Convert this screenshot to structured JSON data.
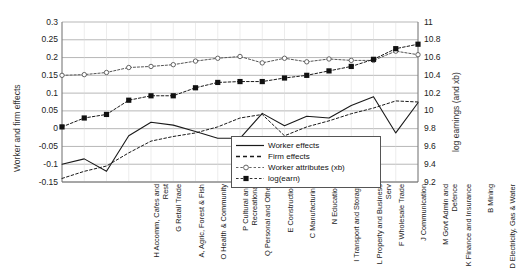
{
  "chart_data": {
    "type": "line",
    "title": "",
    "xlabel": "",
    "ylabel": "Worker and firm effects",
    "ylabel_right": "log earnings (and xb)",
    "grid": true,
    "legend_position": "inside-bottom-right",
    "ylim": [
      -0.15,
      0.3
    ],
    "yticks": [
      "0.3",
      "0.25",
      "0.2",
      "0.15",
      "0.1",
      "0.05",
      "0",
      "-0.05",
      "-0.1",
      "-0.15"
    ],
    "ylim_right": [
      9.2,
      11
    ],
    "yticks_right": [
      "11",
      "10.8",
      "10.6",
      "10.4",
      "10.2",
      "10",
      "9.8",
      "9.6",
      "9.4",
      "9.2"
    ],
    "categories": [
      "H Accomm, Cafes and Rest",
      "G Retail Trade",
      "A, Agric, Forest & Fish",
      "O Health & Community",
      "P Cultural and Recreational",
      "Q Personal and Other",
      "E Construction",
      "C Manufacturing",
      "N Education",
      "I Transport and Storage",
      "L Property and Business Serv",
      "F Wholesale Trade",
      "J Communication",
      "M Govt Admin and Defence",
      "K Finance and Insurance",
      "B Mining",
      "D Electricity, Gas & Water"
    ],
    "series": [
      {
        "name": "Worker effects",
        "axis": "left",
        "style": "solid-line",
        "color": "#1a1a1a",
        "values": [
          -0.1,
          -0.085,
          -0.12,
          -0.02,
          0.018,
          0.01,
          -0.008,
          -0.027,
          -0.027,
          0.043,
          0.008,
          0.035,
          0.03,
          0.065,
          0.09,
          -0.012,
          0.073
        ]
      },
      {
        "name": "Firm effects",
        "axis": "left",
        "style": "dashed-line",
        "color": "#1a1a1a",
        "values": [
          -0.14,
          -0.12,
          -0.105,
          -0.068,
          -0.035,
          -0.022,
          -0.012,
          0.005,
          0.03,
          0.04,
          -0.02,
          0.005,
          0.022,
          0.042,
          0.058,
          0.078,
          0.075
        ]
      },
      {
        "name": "Worker attributes (xb)",
        "axis": "left",
        "style": "open-circle-line",
        "color": "#555555",
        "values": [
          0.15,
          0.152,
          0.158,
          0.172,
          0.175,
          0.18,
          0.19,
          0.198,
          0.203,
          0.185,
          0.198,
          0.188,
          0.196,
          0.192,
          0.192,
          0.218,
          0.208
        ]
      },
      {
        "name": "log(earn)",
        "axis": "right",
        "style": "filled-square-line",
        "color": "#1a1a1a",
        "values": [
          9.82,
          9.92,
          9.96,
          10.12,
          10.17,
          10.17,
          10.26,
          10.32,
          10.33,
          10.33,
          10.37,
          10.4,
          10.45,
          10.5,
          10.58,
          10.7,
          10.75
        ]
      }
    ]
  },
  "legend": {
    "items": [
      {
        "label": "Worker effects",
        "key": "solid-line-key"
      },
      {
        "label": "Firm effects",
        "key": "dashed-line-key"
      },
      {
        "label": "Worker attributes (xb)",
        "key": "open-circle-key"
      },
      {
        "label": "log(earn)",
        "key": "filled-square-key"
      }
    ]
  }
}
